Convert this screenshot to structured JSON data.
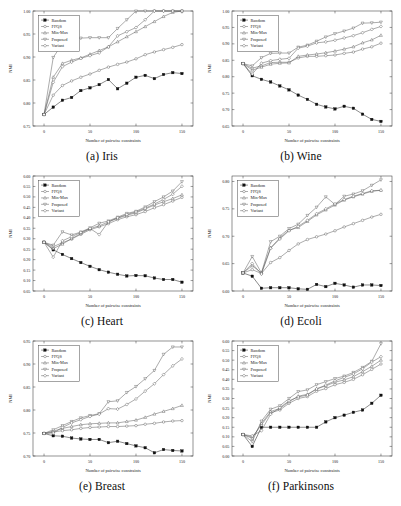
{
  "figure": {
    "xlabel": "Number of pairwise constraints",
    "ylabel": "NMI",
    "xticks": [
      "0",
      "50",
      "100",
      "150"
    ],
    "xlim": [
      -12,
      162
    ],
    "legend": [
      "Random",
      "FFQS",
      "Min-Max",
      "Proposed",
      "Variant"
    ],
    "captions": {
      "a": "(a) Iris",
      "b": "(b) Wine",
      "c": "(c) Heart",
      "d": "(d) Ecoli",
      "e": "(e) Breast",
      "f": "(f) Parkinsons"
    }
  },
  "chart_data": [
    {
      "type": "line",
      "panel": "a",
      "title": "(a) Iris",
      "dataset": "Iris",
      "xlabel": "Number of pairwise constraints",
      "ylabel": "NMI",
      "xlim": [
        -12,
        162
      ],
      "ylim": [
        0.75,
        1.0
      ],
      "yticks": [
        0.75,
        0.8,
        0.85,
        0.9,
        0.95,
        1.0
      ],
      "ytick_labels": [
        "0.75",
        "0.80",
        "0.85",
        "0.90",
        "0.95",
        "1.00"
      ],
      "xticks": [
        0,
        50,
        100,
        150
      ],
      "grid": false,
      "legend_position": "top-left",
      "x": [
        0,
        10,
        20,
        30,
        40,
        50,
        60,
        70,
        80,
        90,
        100,
        110,
        120,
        130,
        140,
        150
      ],
      "series": [
        {
          "name": "Random",
          "marker": "filled-square",
          "values": [
            0.775,
            0.791,
            0.806,
            0.812,
            0.827,
            0.833,
            0.84,
            0.851,
            0.831,
            0.843,
            0.856,
            0.86,
            0.853,
            0.862,
            0.866,
            0.864
          ]
        },
        {
          "name": "FFQS",
          "marker": "open-circle",
          "values": [
            0.775,
            0.817,
            0.838,
            0.848,
            0.856,
            0.863,
            0.871,
            0.878,
            0.884,
            0.889,
            0.896,
            0.905,
            0.911,
            0.916,
            0.921,
            0.927
          ]
        },
        {
          "name": "Min-Max",
          "marker": "open-triangle",
          "values": [
            0.775,
            0.856,
            0.886,
            0.893,
            0.898,
            0.906,
            0.914,
            0.922,
            0.933,
            0.944,
            0.955,
            0.966,
            0.977,
            0.988,
            0.997,
            1.0
          ]
        },
        {
          "name": "Proposed",
          "marker": "open-down-triangle",
          "values": [
            0.775,
            0.899,
            0.929,
            0.938,
            0.941,
            0.942,
            0.942,
            0.942,
            0.962,
            0.981,
            1.0,
            1.0,
            1.0,
            1.0,
            1.0,
            1.0
          ]
        },
        {
          "name": "Variant",
          "marker": "open-diamond",
          "values": [
            0.775,
            0.845,
            0.879,
            0.889,
            0.897,
            0.903,
            0.909,
            0.922,
            0.946,
            0.955,
            0.964,
            0.981,
            1.0,
            1.0,
            1.0,
            1.0
          ]
        }
      ]
    },
    {
      "type": "line",
      "panel": "b",
      "title": "(b) Wine",
      "dataset": "Wine",
      "xlabel": "Number of pairwise constraints",
      "ylabel": "NMI",
      "xlim": [
        -12,
        162
      ],
      "ylim": [
        0.65,
        1.0
      ],
      "yticks": [
        0.65,
        0.7,
        0.75,
        0.8,
        0.85,
        0.9,
        0.95,
        1.0
      ],
      "ytick_labels": [
        "0.65",
        "0.70",
        "0.75",
        "0.80",
        "0.85",
        "0.90",
        "0.95",
        "1.00"
      ],
      "xticks": [
        0,
        50,
        100,
        150
      ],
      "grid": false,
      "legend_position": "top-left",
      "x": [
        0,
        10,
        20,
        30,
        40,
        50,
        60,
        70,
        80,
        90,
        100,
        110,
        120,
        130,
        140,
        150
      ],
      "series": [
        {
          "name": "Random",
          "marker": "filled-square",
          "values": [
            0.84,
            0.803,
            0.792,
            0.784,
            0.772,
            0.76,
            0.744,
            0.731,
            0.716,
            0.708,
            0.702,
            0.71,
            0.704,
            0.686,
            0.67,
            0.664
          ]
        },
        {
          "name": "FFQS",
          "marker": "open-circle",
          "values": [
            0.84,
            0.826,
            0.833,
            0.843,
            0.844,
            0.844,
            0.857,
            0.862,
            0.862,
            0.864,
            0.866,
            0.871,
            0.875,
            0.884,
            0.891,
            0.902
          ]
        },
        {
          "name": "Min-Max",
          "marker": "open-triangle",
          "values": [
            0.84,
            0.82,
            0.829,
            0.838,
            0.841,
            0.842,
            0.862,
            0.866,
            0.869,
            0.873,
            0.878,
            0.884,
            0.891,
            0.903,
            0.912,
            0.926
          ]
        },
        {
          "name": "Proposed",
          "marker": "open-down-triangle",
          "values": [
            0.84,
            0.833,
            0.858,
            0.871,
            0.872,
            0.872,
            0.89,
            0.896,
            0.908,
            0.921,
            0.931,
            0.939,
            0.948,
            0.963,
            0.964,
            0.966
          ]
        },
        {
          "name": "Variant",
          "marker": "open-diamond",
          "values": [
            0.84,
            0.808,
            0.841,
            0.849,
            0.853,
            0.856,
            0.887,
            0.893,
            0.903,
            0.906,
            0.911,
            0.918,
            0.925,
            0.934,
            0.944,
            0.953
          ]
        }
      ]
    },
    {
      "type": "line",
      "panel": "c",
      "title": "(c) Heart",
      "dataset": "Heart",
      "xlabel": "Number of pairwise constraints",
      "ylabel": "NMI",
      "xlim": [
        -12,
        162
      ],
      "ylim": [
        0.05,
        0.6
      ],
      "yticks": [
        0.05,
        0.1,
        0.15,
        0.2,
        0.25,
        0.3,
        0.35,
        0.4,
        0.45,
        0.5,
        0.55,
        0.6
      ],
      "ytick_labels": [
        "0.05",
        "0.10",
        "0.15",
        "0.20",
        "0.25",
        "0.30",
        "0.35",
        "0.40",
        "0.45",
        "0.50",
        "0.55",
        "0.60"
      ],
      "xticks": [
        0,
        50,
        100,
        150
      ],
      "grid": false,
      "legend_position": "top-left",
      "x": [
        0,
        10,
        20,
        30,
        40,
        50,
        60,
        70,
        80,
        90,
        100,
        110,
        120,
        130,
        140,
        150
      ],
      "series": [
        {
          "name": "Random",
          "marker": "filled-square",
          "values": [
            0.283,
            0.247,
            0.225,
            0.205,
            0.186,
            0.168,
            0.152,
            0.14,
            0.13,
            0.122,
            0.124,
            0.123,
            0.112,
            0.105,
            0.105,
            0.092
          ]
        },
        {
          "name": "FFQS",
          "marker": "open-circle",
          "values": [
            0.283,
            0.262,
            0.281,
            0.298,
            0.321,
            0.343,
            0.357,
            0.372,
            0.391,
            0.405,
            0.415,
            0.43,
            0.448,
            0.463,
            0.48,
            0.498
          ]
        },
        {
          "name": "Min-Max",
          "marker": "open-triangle",
          "values": [
            0.283,
            0.253,
            0.274,
            0.301,
            0.325,
            0.348,
            0.362,
            0.38,
            0.398,
            0.412,
            0.424,
            0.442,
            0.461,
            0.477,
            0.492,
            0.51
          ]
        },
        {
          "name": "Proposed",
          "marker": "open-down-triangle",
          "values": [
            0.283,
            0.269,
            0.333,
            0.318,
            0.332,
            0.352,
            0.374,
            0.385,
            0.403,
            0.421,
            0.431,
            0.452,
            0.477,
            0.5,
            0.528,
            0.573
          ]
        },
        {
          "name": "Variant",
          "marker": "open-diamond",
          "values": [
            0.283,
            0.212,
            0.29,
            0.31,
            0.33,
            0.349,
            0.32,
            0.381,
            0.4,
            0.416,
            0.428,
            0.446,
            0.466,
            0.488,
            0.513,
            0.551
          ]
        }
      ]
    },
    {
      "type": "line",
      "panel": "d",
      "title": "(d) Ecoli",
      "dataset": "Ecoli",
      "xlabel": "Number of pairwise constraints",
      "ylabel": "NMI",
      "xlim": [
        -12,
        162
      ],
      "ylim": [
        0.6,
        0.81
      ],
      "yticks": [
        0.6,
        0.65,
        0.7,
        0.75,
        0.8
      ],
      "ytick_labels": [
        "0.60",
        "0.65",
        "0.70",
        "0.75",
        "0.80"
      ],
      "xticks": [
        0,
        50,
        100,
        150
      ],
      "grid": false,
      "legend_position": "top-left",
      "x": [
        0,
        10,
        20,
        30,
        40,
        50,
        60,
        70,
        80,
        90,
        100,
        110,
        120,
        130,
        140,
        150
      ],
      "series": [
        {
          "name": "Random",
          "marker": "filled-square",
          "values": [
            0.633,
            0.627,
            0.605,
            0.606,
            0.606,
            0.606,
            0.604,
            0.603,
            0.612,
            0.608,
            0.614,
            0.611,
            0.607,
            0.611,
            0.611,
            0.61
          ]
        },
        {
          "name": "FFQS",
          "marker": "open-circle",
          "values": [
            0.633,
            0.639,
            0.632,
            0.652,
            0.661,
            0.674,
            0.686,
            0.694,
            0.699,
            0.704,
            0.71,
            0.717,
            0.723,
            0.729,
            0.735,
            0.74
          ]
        },
        {
          "name": "Min-Max",
          "marker": "open-triangle",
          "values": [
            0.633,
            0.646,
            0.633,
            0.679,
            0.697,
            0.711,
            0.716,
            0.727,
            0.739,
            0.748,
            0.757,
            0.766,
            0.772,
            0.777,
            0.782,
            0.784
          ]
        },
        {
          "name": "Proposed",
          "marker": "open-down-triangle",
          "values": [
            0.633,
            0.663,
            0.633,
            0.69,
            0.7,
            0.714,
            0.722,
            0.738,
            0.753,
            0.772,
            0.758,
            0.773,
            0.777,
            0.783,
            0.793,
            0.803
          ]
        },
        {
          "name": "Variant",
          "marker": "open-diamond",
          "values": [
            0.633,
            0.65,
            0.631,
            0.678,
            0.695,
            0.71,
            0.718,
            0.729,
            0.741,
            0.75,
            0.759,
            0.767,
            0.773,
            0.778,
            0.783,
            0.784
          ]
        }
      ]
    },
    {
      "type": "line",
      "panel": "e",
      "title": "(e) Breast",
      "dataset": "Breast",
      "xlabel": "Number of pairwise constraints",
      "ylabel": "NMI",
      "xlim": [
        -12,
        162
      ],
      "ylim": [
        0.7,
        0.95
      ],
      "yticks": [
        0.7,
        0.75,
        0.8,
        0.85,
        0.9,
        0.95
      ],
      "ytick_labels": [
        "0.70",
        "0.75",
        "0.80",
        "0.85",
        "0.90",
        "0.95"
      ],
      "xticks": [
        0,
        50,
        100,
        150
      ],
      "grid": false,
      "legend_position": "top-left",
      "x": [
        0,
        10,
        20,
        30,
        40,
        50,
        60,
        70,
        80,
        90,
        100,
        110,
        120,
        130,
        140,
        150
      ],
      "series": [
        {
          "name": "Random",
          "marker": "filled-square",
          "values": [
            0.749,
            0.744,
            0.743,
            0.739,
            0.737,
            0.736,
            0.736,
            0.729,
            0.732,
            0.727,
            0.722,
            0.718,
            0.707,
            0.714,
            0.712,
            0.711
          ]
        },
        {
          "name": "FFQS",
          "marker": "open-circle",
          "values": [
            0.749,
            0.752,
            0.755,
            0.757,
            0.76,
            0.762,
            0.763,
            0.764,
            0.764,
            0.765,
            0.766,
            0.769,
            0.771,
            0.774,
            0.776,
            0.777
          ]
        },
        {
          "name": "Min-Max",
          "marker": "open-triangle",
          "values": [
            0.749,
            0.754,
            0.76,
            0.764,
            0.768,
            0.77,
            0.771,
            0.772,
            0.772,
            0.775,
            0.778,
            0.784,
            0.791,
            0.797,
            0.803,
            0.81
          ]
        },
        {
          "name": "Proposed",
          "marker": "open-down-triangle",
          "values": [
            0.749,
            0.757,
            0.766,
            0.775,
            0.783,
            0.788,
            0.792,
            0.818,
            0.82,
            0.838,
            0.851,
            0.868,
            0.886,
            0.921,
            0.937,
            0.937
          ]
        },
        {
          "name": "Variant",
          "marker": "open-diamond",
          "values": [
            0.749,
            0.75,
            0.762,
            0.772,
            0.779,
            0.786,
            0.791,
            0.803,
            0.802,
            0.812,
            0.824,
            0.841,
            0.857,
            0.877,
            0.896,
            0.911
          ]
        }
      ]
    },
    {
      "type": "line",
      "panel": "f",
      "title": "(f) Parkinsons",
      "dataset": "Parkinsons",
      "xlabel": "Number of pairwise constraints",
      "ylabel": "NMI",
      "xlim": [
        -12,
        162
      ],
      "ylim": [
        0.0,
        0.6
      ],
      "yticks": [
        0.0,
        0.05,
        0.1,
        0.15,
        0.2,
        0.25,
        0.3,
        0.35,
        0.4,
        0.45,
        0.5,
        0.55,
        0.6
      ],
      "ytick_labels": [
        "0.00",
        "0.05",
        "0.10",
        "0.15",
        "0.20",
        "0.25",
        "0.30",
        "0.35",
        "0.40",
        "0.45",
        "0.50",
        "0.55",
        "0.60"
      ],
      "xticks": [
        0,
        50,
        100,
        150
      ],
      "grid": false,
      "legend_position": "top-left",
      "x": [
        0,
        10,
        20,
        30,
        40,
        50,
        60,
        70,
        80,
        90,
        100,
        110,
        120,
        130,
        140,
        150
      ],
      "series": [
        {
          "name": "Random",
          "marker": "filled-square",
          "values": [
            0.112,
            0.05,
            0.15,
            0.15,
            0.15,
            0.15,
            0.15,
            0.15,
            0.15,
            0.178,
            0.2,
            0.213,
            0.228,
            0.24,
            0.275,
            0.317
          ]
        },
        {
          "name": "FFQS",
          "marker": "open-circle",
          "values": [
            0.112,
            0.098,
            0.162,
            0.226,
            0.24,
            0.275,
            0.3,
            0.31,
            0.338,
            0.352,
            0.372,
            0.384,
            0.4,
            0.424,
            0.452,
            0.48
          ]
        },
        {
          "name": "Min-Max",
          "marker": "open-triangle",
          "values": [
            0.112,
            0.092,
            0.17,
            0.232,
            0.248,
            0.283,
            0.312,
            0.322,
            0.35,
            0.366,
            0.385,
            0.397,
            0.414,
            0.44,
            0.468,
            0.5
          ]
        },
        {
          "name": "Proposed",
          "marker": "open-down-triangle",
          "values": [
            0.112,
            0.075,
            0.182,
            0.244,
            0.262,
            0.3,
            0.336,
            0.345,
            0.372,
            0.388,
            0.404,
            0.417,
            0.436,
            0.462,
            0.494,
            0.586
          ]
        },
        {
          "name": "Variant",
          "marker": "open-diamond",
          "values": [
            0.112,
            0.105,
            0.132,
            0.218,
            0.252,
            0.288,
            0.308,
            0.318,
            0.35,
            0.37,
            0.392,
            0.41,
            0.428,
            0.455,
            0.49,
            0.518
          ]
        }
      ]
    }
  ]
}
